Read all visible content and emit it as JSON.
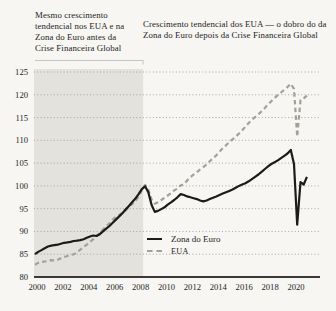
{
  "figure": {
    "annotation_left": "Mesmo crescimento tendencial nos EUA e na Zona do Euro antes da Crise Financeira Global",
    "annotation_right": "Crescimento tendencial dos EUA — o dobro do da Zona do Euro depois da Crise Financeira Global"
  },
  "legend": {
    "items": [
      {
        "label": "Zona do Euro",
        "style": "solid",
        "color": "#1b1b19"
      },
      {
        "label": "EUA",
        "style": "dashed",
        "color": "#a3a09a"
      }
    ]
  },
  "colors": {
    "background": "#f7f6f2",
    "shaded_region": "#e4e2dc",
    "gridline": "#a09e98",
    "axis_line": "#3a3937",
    "bracket_line": "#c7c5bf",
    "text": "#1e1d1b"
  },
  "chart_data": {
    "type": "line",
    "title": "",
    "xlabel": "",
    "ylabel": "",
    "xlim": [
      2000,
      2022
    ],
    "ylim": [
      80,
      126
    ],
    "x_ticks": [
      2000,
      2002,
      2004,
      2006,
      2008,
      2010,
      2012,
      2014,
      2016,
      2018,
      2020
    ],
    "y_ticks": [
      80,
      85,
      90,
      95,
      100,
      105,
      110,
      115,
      120,
      125
    ],
    "grid": "dotted horizontal gridlines, solid baseline at 80",
    "legend_position": "inside center-bottom",
    "shaded_region": {
      "x0": 2000,
      "x1": 2008.35
    },
    "x_start": 2000,
    "x_step": 0.25,
    "series": [
      {
        "name": "Zona do Euro",
        "style": "solid",
        "color": "#1b1b19",
        "values": [
          85.0,
          85.5,
          85.9,
          86.3,
          86.7,
          86.9,
          87.0,
          87.1,
          87.3,
          87.5,
          87.6,
          87.7,
          87.9,
          88.0,
          88.1,
          88.3,
          88.6,
          88.9,
          89.1,
          89.0,
          89.4,
          90.0,
          90.6,
          91.2,
          91.9,
          92.6,
          93.3,
          94.0,
          94.8,
          95.6,
          96.4,
          97.2,
          98.2,
          99.3,
          99.9,
          98.6,
          95.8,
          94.3,
          94.5,
          94.9,
          95.3,
          95.9,
          96.4,
          96.9,
          97.5,
          98.2,
          98.0,
          97.7,
          97.5,
          97.3,
          97.1,
          96.8,
          96.6,
          96.8,
          97.1,
          97.4,
          97.7,
          98.0,
          98.3,
          98.6,
          98.9,
          99.2,
          99.6,
          100.0,
          100.3,
          100.6,
          101.0,
          101.5,
          102.0,
          102.5,
          103.1,
          103.7,
          104.3,
          104.8,
          105.2,
          105.6,
          106.1,
          106.6,
          107.1,
          107.9,
          104.8,
          91.5,
          100.8,
          100.3,
          102.0
        ]
      },
      {
        "name": "EUA",
        "style": "dashed",
        "color": "#a3a09a",
        "values": [
          82.7,
          83.1,
          83.3,
          83.4,
          83.5,
          83.7,
          83.6,
          83.8,
          84.1,
          84.4,
          84.6,
          84.8,
          85.0,
          85.4,
          86.0,
          86.6,
          87.1,
          87.7,
          88.3,
          89.0,
          89.7,
          90.4,
          91.1,
          91.8,
          92.6,
          93.2,
          93.6,
          94.1,
          94.6,
          95.3,
          96.0,
          96.6,
          97.7,
          99.0,
          100.2,
          99.2,
          97.0,
          96.1,
          96.4,
          96.9,
          97.4,
          97.9,
          98.4,
          99.0,
          99.4,
          100.1,
          100.4,
          101.2,
          101.9,
          102.5,
          103.0,
          103.6,
          104.1,
          104.7,
          105.4,
          106.1,
          106.7,
          107.5,
          108.3,
          108.9,
          109.6,
          110.2,
          110.8,
          111.5,
          112.2,
          113.0,
          113.8,
          114.5,
          115.1,
          115.7,
          116.4,
          117.1,
          117.9,
          118.6,
          119.3,
          119.9,
          120.5,
          121.1,
          121.7,
          122.4,
          121.3,
          110.8,
          118.8,
          119.2,
          119.8
        ]
      }
    ]
  }
}
